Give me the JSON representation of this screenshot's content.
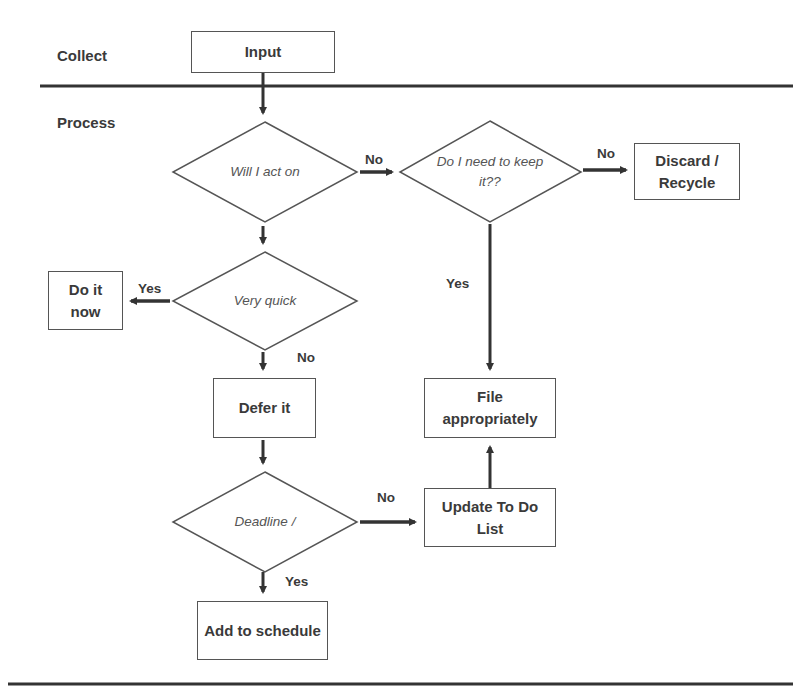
{
  "lanes": {
    "collect": "Collect",
    "process": "Process"
  },
  "nodes": {
    "input": "Input",
    "will_act": "Will I act on",
    "keep_it": "Do I need to keep it??",
    "discard": "Discard / Recycle",
    "very_quick": "Very quick",
    "do_it_now": "Do it now",
    "defer_it": "Defer it",
    "file": "File appropriately",
    "deadline": "Deadline /",
    "update_todo": "Update To Do List",
    "add_schedule": "Add to schedule"
  },
  "edges": {
    "act_no": "No",
    "keep_no": "No",
    "keep_yes": "Yes",
    "quick_yes": "Yes",
    "quick_no": "No",
    "deadline_no": "No",
    "deadline_yes": "Yes"
  },
  "colors": {
    "line": "#3a3a3a",
    "shape_border": "#555555",
    "text": "#3a3a3a"
  }
}
